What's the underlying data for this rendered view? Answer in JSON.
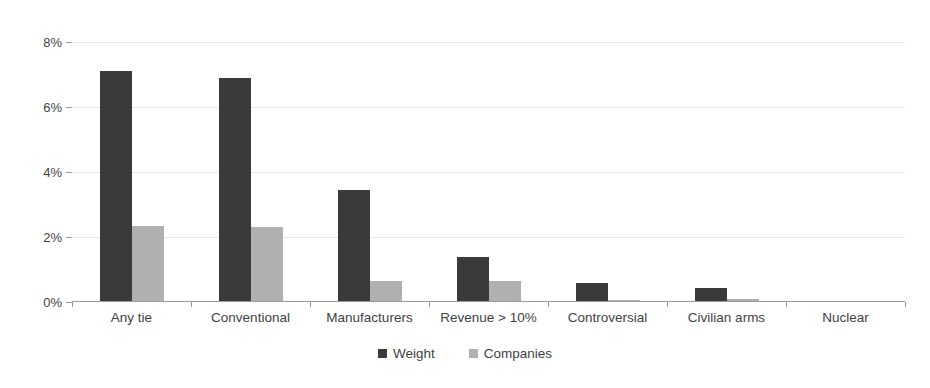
{
  "chart_data": {
    "type": "bar",
    "title": "",
    "subtitle": "",
    "xlabel": "",
    "ylabel": "",
    "ylim": [
      0,
      8
    ],
    "ytick_labels": [
      "0%",
      "2%",
      "4%",
      "6%",
      "8%"
    ],
    "ytick_values": [
      0,
      2,
      4,
      6,
      8
    ],
    "grid": true,
    "grid_axis": "y",
    "legend_position": "bottom-center",
    "value_unit": "%",
    "categories": [
      "Any tie",
      "Conventional",
      "Manufacturers",
      "Revenue > 10%",
      "Controversial",
      "Civilian arms",
      "Nuclear"
    ],
    "series": [
      {
        "name": "Weight",
        "color": "#3a3a3a",
        "values": [
          7.1,
          6.9,
          3.45,
          1.4,
          0.6,
          0.42,
          0.0
        ]
      },
      {
        "name": "Companies",
        "color": "#b0b0b0",
        "values": [
          2.35,
          2.3,
          0.65,
          0.65,
          0.05,
          0.1,
          0.0
        ]
      }
    ]
  },
  "legend": {
    "items": [
      {
        "label": "Weight",
        "color": "#3a3a3a"
      },
      {
        "label": "Companies",
        "color": "#b0b0b0"
      }
    ]
  },
  "colors": {
    "weight": "#3a3a3a",
    "companies": "#b0b0b0",
    "gridline": "#e8e8e8",
    "axis": "#9a9a9a",
    "text": "#3f3f3f",
    "background": "#ffffff"
  }
}
